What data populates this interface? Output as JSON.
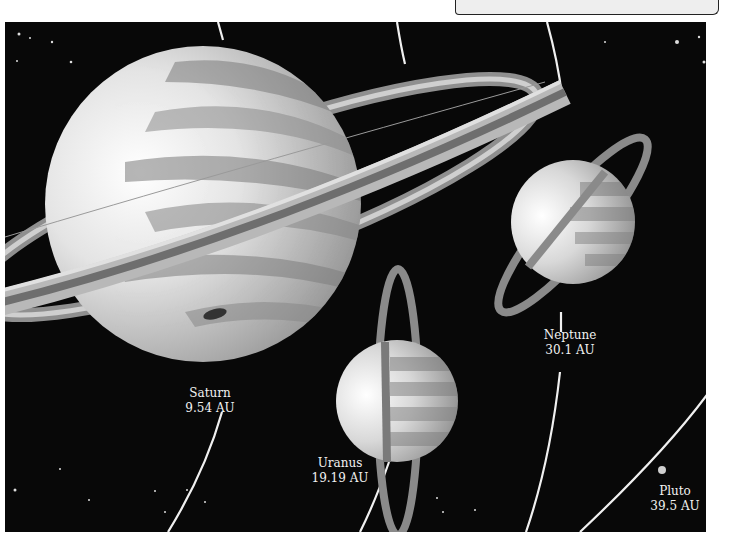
{
  "figure": {
    "background_color": "#080808",
    "orbit_color": "#f0f0f0"
  },
  "planets": [
    {
      "name": "Saturn",
      "distance": "9.54 AU"
    },
    {
      "name": "Uranus",
      "distance": "19.19 AU"
    },
    {
      "name": "Neptune",
      "distance": "30.1 AU"
    },
    {
      "name": "Pluto",
      "distance": "39.5 AU"
    }
  ]
}
